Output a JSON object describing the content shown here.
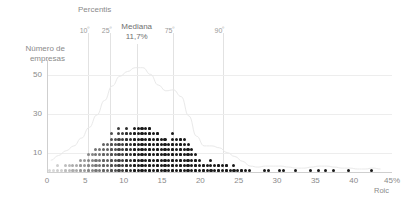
{
  "axes": {
    "y_title_line1": "Número de",
    "y_title_line2": "empresas",
    "x_title": "Roic",
    "y_ticks": [
      "50",
      "30",
      "10"
    ],
    "x_ticks": [
      "0",
      "5",
      "10",
      "15",
      "20",
      "25",
      "30",
      "35",
      "40",
      "45%"
    ]
  },
  "percentiles": {
    "title": "Percentis",
    "p10_label": "10",
    "p10_sup": "º",
    "p25_label": "25",
    "p25_sup": "º",
    "median_label": "Mediana",
    "median_value": "11,7%",
    "p75_label": "75",
    "p75_sup": "º",
    "p90_label": "90",
    "p90_sup": "º"
  },
  "colors": {
    "dot_light": "#d9d9d9",
    "dot_dark": "#1a1a1a",
    "axis": "#cfcfcf",
    "grid": "#ededed",
    "text": "#8a8a8a",
    "curve": "#e8e8e8"
  },
  "chart_data": {
    "type": "bar",
    "xlabel": "Roic",
    "ylabel": "Número de empresas",
    "xlim": [
      0,
      45
    ],
    "ylim": [
      0,
      58
    ],
    "grid": true,
    "legend": false,
    "bin_width": 1,
    "unit": "%",
    "dot_value": 2,
    "categories": [
      1,
      2,
      3,
      4,
      5,
      6,
      7,
      8,
      9,
      10,
      11,
      12,
      13,
      14,
      15,
      16,
      17,
      18,
      19,
      20,
      21,
      22,
      23,
      24,
      25,
      26,
      27,
      28,
      29,
      30,
      31,
      32,
      33,
      34,
      35,
      36,
      37,
      38,
      39,
      40,
      41,
      42,
      43,
      44
    ],
    "values": [
      4,
      8,
      10,
      12,
      16,
      22,
      28,
      36,
      44,
      50,
      50,
      54,
      54,
      50,
      44,
      38,
      44,
      40,
      28,
      16,
      10,
      14,
      12,
      8,
      8,
      4,
      2,
      0,
      4,
      0,
      4,
      0,
      2,
      0,
      2,
      2,
      2,
      2,
      0,
      2,
      0,
      0,
      2,
      0
    ],
    "annotations": [
      {
        "label": "10º",
        "x": 5.3,
        "type": "percentile"
      },
      {
        "label": "25º",
        "x": 8.2,
        "type": "percentile"
      },
      {
        "label": "Mediana",
        "value": "11,7%",
        "x": 11.7,
        "type": "median"
      },
      {
        "label": "75º",
        "x": 16.2,
        "type": "percentile"
      },
      {
        "label": "90º",
        "x": 22.8,
        "type": "percentile"
      }
    ]
  }
}
